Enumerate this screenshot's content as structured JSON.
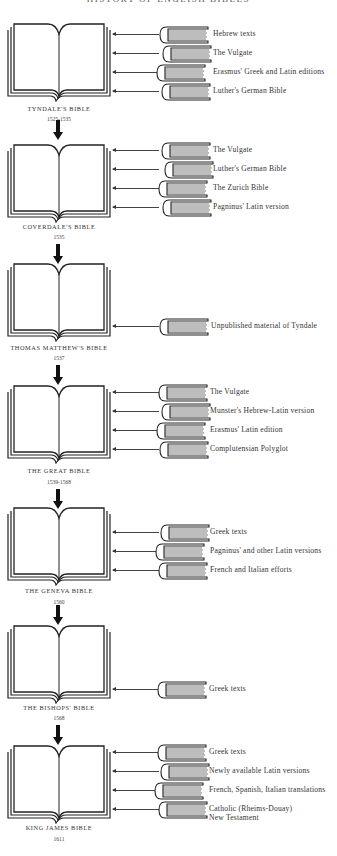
{
  "title": "HISTORY OF ENGLISH BIBLES",
  "bibles": [
    {
      "name": "TYNDALE'S BIBLE",
      "date": "1525-1535",
      "sources": [
        "Hebrew texts",
        "The Vulgate",
        "Erasmus' Greek and Latin editions",
        "Luther's German Bible"
      ]
    },
    {
      "name": "COVERDALE'S BIBLE",
      "date": "1535",
      "sources": [
        "The Vulgate",
        "Luther's German Bible",
        "The Zurich Bible",
        "Pagninus' Latin version"
      ]
    },
    {
      "name": "THOMAS MATTHEW'S BIBLE",
      "date": "1537",
      "sources": [
        "Unpublished material of Tyndale"
      ]
    },
    {
      "name": "THE GREAT BIBLE",
      "date": "1539-1568",
      "sources": [
        "The Vulgate",
        "Munster's Hebrew-Latin version",
        "Erasmus' Latin edition",
        "Complutensian Polyglot"
      ]
    },
    {
      "name": "THE GENEVA BIBLE",
      "date": "1560",
      "sources": [
        "Greek texts",
        "Pagninus' and other Latin versions",
        "French and Italian efforts"
      ]
    },
    {
      "name": "THE BISHOPS' BIBLE",
      "date": "1568",
      "sources": [
        "Greek texts"
      ]
    },
    {
      "name": "KING JAMES BIBLE",
      "date": "1611",
      "sources": [
        "Greek texts",
        "Newly available Latin versions",
        "French, Spanish, Italian translations",
        "Catholic (Rheims-Douay)",
        "New Testament"
      ]
    }
  ],
  "icons": {
    "open_bible": "open-book-icon",
    "source_book": "closed-book-icon",
    "succession_arrow": "down-arrow-icon",
    "influence_arrow": "left-arrow-icon"
  },
  "colors": {
    "ink": "#222222",
    "background": "#ffffff"
  }
}
